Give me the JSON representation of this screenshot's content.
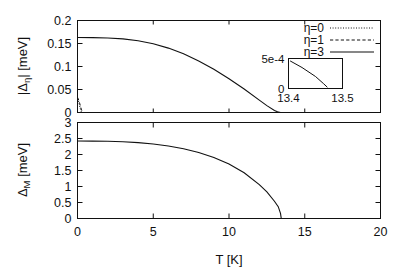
{
  "figure": {
    "name": "two-panel-order-parameter-vs-temperature",
    "background": "#ffffff",
    "line_color": "#111111"
  },
  "panels": {
    "top": {
      "ylabel": "|Δη| [meV]",
      "ylabel_parts": {
        "pre": "|Δ",
        "sub": "η",
        "post": "| [meV]"
      },
      "yticks": [
        "0",
        "0.05",
        "0.1",
        "0.15",
        "0.2"
      ],
      "ytick_values": [
        0,
        0.05,
        0.1,
        0.15,
        0.2
      ],
      "xticks": [
        "",
        "",
        "",
        "",
        ""
      ],
      "xtick_values": [
        0,
        5,
        10,
        15,
        20
      ],
      "ylim": [
        0,
        0.2
      ],
      "xlim": [
        0,
        20
      ]
    },
    "bottom": {
      "ylabel": "ΔM [meV]",
      "ylabel_parts": {
        "pre": "Δ",
        "sub": "M",
        "post": " [meV]"
      },
      "yticks": [
        "0",
        "0.5",
        "1",
        "1.5",
        "2",
        "2.5",
        "3"
      ],
      "ytick_values": [
        0,
        0.5,
        1,
        1.5,
        2,
        2.5,
        3
      ],
      "xticks": [
        "0",
        "5",
        "10",
        "15",
        "20"
      ],
      "xtick_values": [
        0,
        5,
        10,
        15,
        20
      ],
      "xlabel": "T [K]",
      "ylim": [
        0,
        3
      ],
      "xlim": [
        0,
        20
      ]
    }
  },
  "legend": {
    "position": "top-right",
    "entries": [
      {
        "label": "η=0",
        "style": "dotted"
      },
      {
        "label": "η=1",
        "style": "dashed"
      },
      {
        "label": "η=3",
        "style": "solid"
      }
    ]
  },
  "inset": {
    "yticks": [
      "0",
      "5e-4"
    ],
    "ytick_values": [
      0,
      0.0005
    ],
    "xticks": [
      "13.4",
      "13.5"
    ],
    "xtick_values": [
      13.4,
      13.5
    ],
    "ylim": [
      0,
      0.0005
    ],
    "xlim": [
      13.4,
      13.5
    ]
  },
  "chart_data": [
    {
      "type": "line",
      "panel": "top",
      "title": "",
      "xlabel": "",
      "ylabel": "|Δη| [meV]",
      "xlim": [
        0,
        20
      ],
      "ylim": [
        0,
        0.2
      ],
      "grid": false,
      "legend_position": "top-right",
      "series": [
        {
          "name": "η=0",
          "style": "dotted",
          "x": [
            0.0,
            0.04,
            0.08,
            0.12,
            0.16,
            0.2,
            0.25,
            0.3
          ],
          "y": [
            0.0305,
            0.0272,
            0.0228,
            0.0175,
            0.0118,
            0.0062,
            0.0018,
            0.0
          ]
        },
        {
          "name": "η=1",
          "style": "dashed",
          "x": [
            0.0,
            0.05,
            0.1,
            0.15,
            0.2,
            0.25,
            0.3,
            0.36
          ],
          "y": [
            0.033,
            0.0296,
            0.0248,
            0.0192,
            0.0132,
            0.0074,
            0.0025,
            0.0
          ]
        },
        {
          "name": "η=3",
          "style": "solid",
          "x": [
            0,
            1,
            2,
            3,
            4,
            5,
            6,
            7,
            8,
            9,
            10,
            11,
            12,
            12.5,
            13,
            13.2,
            13.4
          ],
          "y": [
            0.163,
            0.1628,
            0.162,
            0.16,
            0.156,
            0.1495,
            0.14,
            0.1275,
            0.112,
            0.094,
            0.0735,
            0.051,
            0.0268,
            0.015,
            0.0045,
            0.0018,
            0.0
          ]
        }
      ]
    },
    {
      "type": "line",
      "panel": "bottom",
      "title": "",
      "xlabel": "T [K]",
      "ylabel": "ΔM [meV]",
      "xlim": [
        0,
        20
      ],
      "ylim": [
        0,
        3
      ],
      "grid": false,
      "series": [
        {
          "name": "ΔM",
          "style": "solid",
          "x": [
            0,
            1,
            2,
            3,
            4,
            5,
            6,
            7,
            8,
            9,
            10,
            11,
            12,
            12.5,
            13,
            13.25,
            13.4,
            13.45
          ],
          "y": [
            2.42,
            2.418,
            2.412,
            2.398,
            2.372,
            2.33,
            2.268,
            2.18,
            2.062,
            1.905,
            1.7,
            1.43,
            1.06,
            0.83,
            0.54,
            0.37,
            0.16,
            0.0
          ]
        }
      ]
    },
    {
      "type": "line",
      "panel": "inset",
      "title": "",
      "xlabel": "",
      "ylabel": "",
      "xlim": [
        13.4,
        13.5
      ],
      "ylim": [
        0,
        0.0005
      ],
      "grid": false,
      "series": [
        {
          "name": "inset-detail",
          "style": "solid",
          "x": [
            13.403,
            13.425,
            13.45,
            13.465,
            13.472
          ],
          "y": [
            0.00046,
            0.00035,
            0.0002,
            8e-05,
            2e-05
          ]
        }
      ]
    }
  ]
}
